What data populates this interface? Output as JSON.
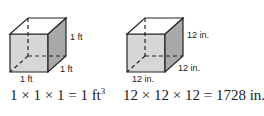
{
  "figures": [
    {
      "name": "cube-1ft",
      "labels": {
        "height": "1 ft",
        "depth": "1 ft",
        "width": "1 ft"
      },
      "equation": {
        "text": "1 × 1 × 1 = 1 ft",
        "exponent": "3"
      }
    },
    {
      "name": "cube-12in",
      "labels": {
        "height": "12 in.",
        "depth": "12 in.",
        "width": "12 in."
      },
      "equation": {
        "text": "12 × 12 × 12 = 1728 in.",
        "exponent": "3"
      }
    }
  ],
  "colors": {
    "front_face": "#d6d6d6",
    "side_face": "#a9a9a9",
    "top_face": "#ffffff",
    "edge": "#222222"
  }
}
